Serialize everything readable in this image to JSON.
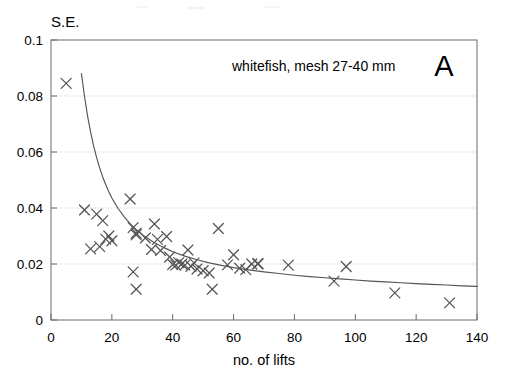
{
  "figure": {
    "panel_letter": "A",
    "annotation": "whitefish, mesh 27-40 mm",
    "y_axis_label": "S.E.",
    "x_axis_label": "no. of lifts"
  },
  "chart_data": {
    "type": "scatter",
    "title": "whitefish, mesh 27-40 mm",
    "panel": "A",
    "xlabel": "no. of lifts",
    "ylabel": "S.E.",
    "xlim": [
      0,
      140
    ],
    "ylim": [
      0,
      0.1
    ],
    "xticks": [
      0,
      20,
      40,
      60,
      80,
      100,
      120,
      140
    ],
    "yticks": [
      0,
      0.02,
      0.04,
      0.06,
      0.08,
      0.1
    ],
    "xtick_labels": [
      "0",
      "20",
      "40",
      "60",
      "80",
      "100",
      "120",
      "140"
    ],
    "ytick_labels": [
      "0",
      "0.02",
      "0.04",
      "0.06",
      "0.08",
      "0.1"
    ],
    "grid": "horizontal-dotted",
    "legend": "none",
    "marker": "x",
    "marker_color": "#555555",
    "series": [
      {
        "name": "observed standard error",
        "type": "scatter",
        "points": [
          [
            5,
            0.0845
          ],
          [
            11,
            0.0393
          ],
          [
            13,
            0.0254
          ],
          [
            15,
            0.0378
          ],
          [
            16,
            0.0262
          ],
          [
            17,
            0.0355
          ],
          [
            18,
            0.0289
          ],
          [
            19,
            0.03
          ],
          [
            20,
            0.0283
          ],
          [
            26,
            0.0432
          ],
          [
            27,
            0.033
          ],
          [
            27,
            0.0172
          ],
          [
            28,
            0.031
          ],
          [
            28,
            0.0304
          ],
          [
            28,
            0.011
          ],
          [
            31,
            0.0293
          ],
          [
            33,
            0.0252
          ],
          [
            34,
            0.0343
          ],
          [
            35,
            0.0288
          ],
          [
            36,
            0.0248
          ],
          [
            38,
            0.0298
          ],
          [
            39,
            0.0225
          ],
          [
            40,
            0.0198
          ],
          [
            41,
            0.0196
          ],
          [
            42,
            0.0205
          ],
          [
            43,
            0.02
          ],
          [
            44,
            0.0196
          ],
          [
            45,
            0.025
          ],
          [
            46,
            0.0192
          ],
          [
            47,
            0.0204
          ],
          [
            48,
            0.0182
          ],
          [
            50,
            0.0176
          ],
          [
            52,
            0.0168
          ],
          [
            53,
            0.011
          ],
          [
            55,
            0.0327
          ],
          [
            58,
            0.0197
          ],
          [
            60,
            0.0233
          ],
          [
            62,
            0.0185
          ],
          [
            64,
            0.018
          ],
          [
            66,
            0.02
          ],
          [
            68,
            0.02
          ],
          [
            68,
            0.0202
          ],
          [
            78,
            0.0196
          ],
          [
            93,
            0.0139
          ],
          [
            97,
            0.0191
          ],
          [
            113,
            0.0097
          ],
          [
            131,
            0.0061
          ]
        ]
      },
      {
        "name": "fitted curve",
        "type": "line",
        "color": "#555555",
        "points": [
          [
            10.0,
            0.088
          ],
          [
            11.0,
            0.08
          ],
          [
            12.0,
            0.073
          ],
          [
            13.0,
            0.0672
          ],
          [
            14.0,
            0.0622
          ],
          [
            15.0,
            0.058
          ],
          [
            16.0,
            0.0543
          ],
          [
            17.0,
            0.0511
          ],
          [
            18.0,
            0.0483
          ],
          [
            19.0,
            0.0458
          ],
          [
            20.0,
            0.0436
          ],
          [
            22.0,
            0.0399
          ],
          [
            24.0,
            0.0369
          ],
          [
            26.0,
            0.0344
          ],
          [
            28.0,
            0.0323
          ],
          [
            30.0,
            0.0305
          ],
          [
            32.0,
            0.029
          ],
          [
            34.0,
            0.0276
          ],
          [
            36.0,
            0.0264
          ],
          [
            38.0,
            0.0254
          ],
          [
            40.0,
            0.0244
          ],
          [
            44.0,
            0.0228
          ],
          [
            48.0,
            0.0215
          ],
          [
            52.0,
            0.0204
          ],
          [
            56.0,
            0.0195
          ],
          [
            60.0,
            0.0187
          ],
          [
            65.0,
            0.0179
          ],
          [
            70.0,
            0.0172
          ],
          [
            75.0,
            0.0166
          ],
          [
            80.0,
            0.016
          ],
          [
            85.0,
            0.0155
          ],
          [
            90.0,
            0.0151
          ],
          [
            95.0,
            0.0147
          ],
          [
            100.0,
            0.0143
          ],
          [
            105.0,
            0.0139
          ],
          [
            110.0,
            0.0136
          ],
          [
            115.0,
            0.0133
          ],
          [
            120.0,
            0.013
          ],
          [
            125.0,
            0.0127
          ],
          [
            130.0,
            0.0125
          ],
          [
            135.0,
            0.0122
          ],
          [
            140.0,
            0.012
          ]
        ]
      }
    ]
  }
}
